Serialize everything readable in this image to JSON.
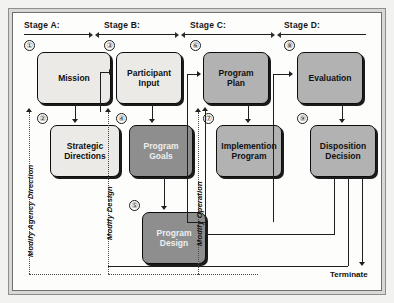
{
  "diagram": {
    "stages": [
      {
        "label": "Stage A:"
      },
      {
        "label": "Stage B:"
      },
      {
        "label": "Stage C:"
      },
      {
        "label": "Stage D:"
      }
    ],
    "nodes": [
      {
        "id": "mission",
        "number": "①",
        "label": "Mission",
        "shade": "light"
      },
      {
        "id": "strategic",
        "number": "②",
        "label": "Strategic\nDirections",
        "shade": "light"
      },
      {
        "id": "participant",
        "number": "③",
        "label": "Participant\nInput",
        "shade": "light"
      },
      {
        "id": "goals",
        "number": "④",
        "label": "Program\nGoals",
        "shade": "dark"
      },
      {
        "id": "design",
        "number": "⑤",
        "label": "Program\nDesign",
        "shade": "dark"
      },
      {
        "id": "plan",
        "number": "⑥",
        "label": "Program\nPlan",
        "shade": "mid"
      },
      {
        "id": "implement",
        "number": "⑦",
        "label": "Implemention\nProgram",
        "shade": "mid"
      },
      {
        "id": "evaluation",
        "number": "⑧",
        "label": "Evaluation",
        "shade": "mid"
      },
      {
        "id": "disposition",
        "number": "⑨",
        "label": "Disposition\nDecision",
        "shade": "mid"
      }
    ],
    "feedback_labels": [
      {
        "id": "modify-agency-direction",
        "label": "Modify Agency Direction"
      },
      {
        "id": "modify-design",
        "label": "Modify Design"
      },
      {
        "id": "modify-operation",
        "label": "Modify Operation"
      }
    ],
    "terminate": {
      "label": "Terminate"
    },
    "colors": {
      "light_fill": "#eceae6",
      "mid_fill": "#b2b2b2",
      "dark_fill": "#8e8e8e",
      "line": "#1f1f1f",
      "page_bg": "#fdfdfb",
      "frame": "#d8d8d6"
    }
  }
}
